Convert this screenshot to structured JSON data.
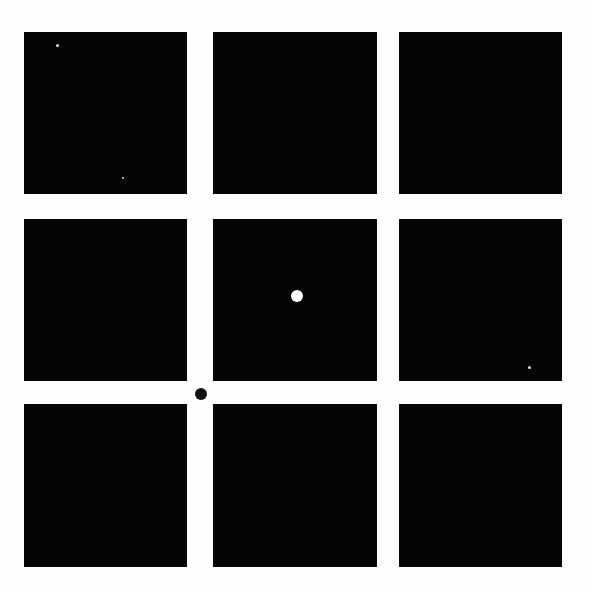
{
  "scene": {
    "background": "#fdfdfd",
    "square_color": "#050505",
    "grid": {
      "rows": 3,
      "cols": 3
    },
    "squares": [
      {
        "row": 1,
        "col": 1,
        "x": 24,
        "y": 32,
        "w": 163,
        "h": 162
      },
      {
        "row": 1,
        "col": 2,
        "x": 213,
        "y": 32,
        "w": 164,
        "h": 162
      },
      {
        "row": 1,
        "col": 3,
        "x": 399,
        "y": 32,
        "w": 163,
        "h": 162
      },
      {
        "row": 2,
        "col": 1,
        "x": 24,
        "y": 219,
        "w": 163,
        "h": 162
      },
      {
        "row": 2,
        "col": 2,
        "x": 213,
        "y": 219,
        "w": 164,
        "h": 162
      },
      {
        "row": 2,
        "col": 3,
        "x": 399,
        "y": 219,
        "w": 163,
        "h": 162
      },
      {
        "row": 3,
        "col": 1,
        "x": 24,
        "y": 404,
        "w": 163,
        "h": 163
      },
      {
        "row": 3,
        "col": 2,
        "x": 213,
        "y": 404,
        "w": 164,
        "h": 163
      },
      {
        "row": 3,
        "col": 3,
        "x": 399,
        "y": 404,
        "w": 163,
        "h": 163
      }
    ],
    "dots": [
      {
        "name": "white-fixation-dot",
        "cx": 297,
        "cy": 296,
        "d": 12,
        "color": "#ffffff"
      },
      {
        "name": "black-gap-dot",
        "cx": 201,
        "cy": 394,
        "d": 12,
        "color": "#111111"
      }
    ],
    "specks": [
      {
        "cx": 57,
        "cy": 45,
        "d": 3
      },
      {
        "cx": 123,
        "cy": 178,
        "d": 2
      },
      {
        "cx": 529,
        "cy": 367,
        "d": 3
      }
    ]
  }
}
